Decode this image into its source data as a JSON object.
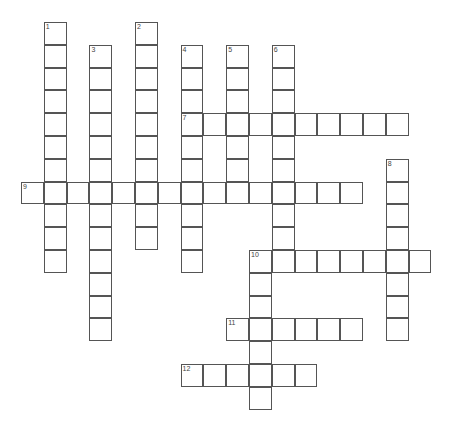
{
  "puzzle": {
    "cell_size": 22.8,
    "origin": {
      "x": 21,
      "y": 22
    },
    "colors": {
      "border": "#555555",
      "cell": "#ffffff",
      "number": "#444444"
    },
    "words": [
      {
        "number": "1",
        "direction": "down",
        "col": 1,
        "row": 0,
        "length": 11
      },
      {
        "number": "2",
        "direction": "down",
        "col": 5,
        "row": 0,
        "length": 10
      },
      {
        "number": "3",
        "direction": "down",
        "col": 3,
        "row": 1,
        "length": 13
      },
      {
        "number": "4",
        "direction": "down",
        "col": 7,
        "row": 1,
        "length": 10
      },
      {
        "number": "5",
        "direction": "down",
        "col": 9,
        "row": 1,
        "length": 7
      },
      {
        "number": "6",
        "direction": "down",
        "col": 11,
        "row": 1,
        "length": 10
      },
      {
        "number": "7",
        "direction": "across",
        "col": 7,
        "row": 4,
        "length": 10
      },
      {
        "number": "8",
        "direction": "down",
        "col": 16,
        "row": 6,
        "length": 8
      },
      {
        "number": "9",
        "direction": "across",
        "col": 0,
        "row": 7,
        "length": 15
      },
      {
        "number": "10",
        "direction": "across",
        "col": 10,
        "row": 10,
        "length": 8
      },
      {
        "number": "",
        "direction": "down",
        "col": 10,
        "row": 10,
        "length": 7
      },
      {
        "number": "11",
        "direction": "across",
        "col": 9,
        "row": 13,
        "length": 6
      },
      {
        "number": "12",
        "direction": "across",
        "col": 7,
        "row": 15,
        "length": 6
      }
    ]
  }
}
